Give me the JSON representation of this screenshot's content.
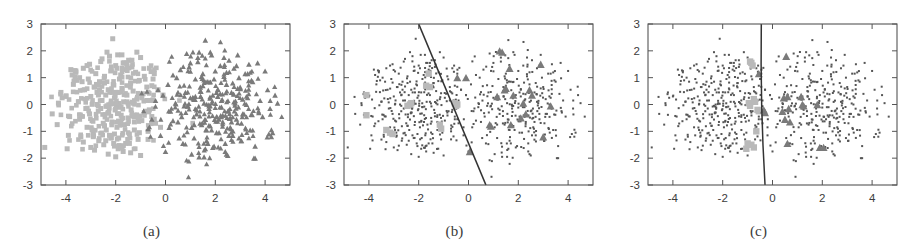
{
  "figure": {
    "title": "",
    "background_color": "#ffffff",
    "panel_count": 3
  },
  "panels": [
    {
      "id": "a",
      "caption": "(a)",
      "has_decision_boundary": false,
      "style": "all-points-large"
    },
    {
      "id": "b",
      "caption": "(b)",
      "has_decision_boundary": true,
      "style": "support-vectors-highlighted"
    },
    {
      "id": "c",
      "caption": "(c)",
      "has_decision_boundary": true,
      "style": "support-vectors-highlighted"
    }
  ],
  "axes": {
    "xlabel": "",
    "ylabel": "",
    "xlim": [
      -5,
      5
    ],
    "ylim": [
      -3,
      3
    ],
    "xticks": [
      -4,
      -2,
      0,
      2,
      4
    ],
    "xtick_labels": [
      "-4",
      "-2",
      "0",
      "2",
      "4"
    ],
    "yticks": [
      3,
      2,
      1,
      0,
      -1,
      -2,
      -3
    ],
    "ytick_labels": [
      "3",
      "2",
      "1",
      "0",
      "-1",
      "-2",
      "-3"
    ],
    "grid": false,
    "frame": true,
    "tick_direction": "in"
  },
  "colors": {
    "class1_marker": "#b9b9b9",
    "class2_marker": "#7a7a7a",
    "small_dot": "#555555",
    "frame": "#555555",
    "boundary_line": "#333333",
    "text": "#3c3c3c",
    "background": "#ffffff"
  },
  "legend": {
    "position": "none",
    "entries": [
      {
        "label": "class 1",
        "marker": "square",
        "color": "#b9b9b9"
      },
      {
        "label": "class 2",
        "marker": "triangle",
        "color": "#7a7a7a"
      }
    ]
  },
  "chart_data": {
    "type": "scatter",
    "title": "",
    "xlabel": "",
    "ylabel": "",
    "xlim": [
      -5,
      5
    ],
    "ylim": [
      -3,
      3
    ],
    "grid": false,
    "legend_position": "none",
    "panels": [
      {
        "id": "a",
        "caption": "(a)",
        "annotations": [],
        "decision_boundary": null,
        "series": [
          {
            "name": "class 1",
            "marker": "square",
            "color": "#b9b9b9",
            "size": "large",
            "x": [
              -4.85,
              -4.55,
              -4.3,
              -4.15,
              -3.95,
              -3.85,
              -3.7,
              -3.6,
              -3.5,
              -3.45,
              -3.4,
              -3.3,
              -3.25,
              -3.2,
              -3.15,
              -3.1,
              -3.05,
              -3.0,
              -2.95,
              -2.9,
              -2.85,
              -2.8,
              -2.75,
              -2.7,
              -2.68,
              -2.65,
              -2.6,
              -2.55,
              -2.5,
              -2.48,
              -2.45,
              -2.4,
              -2.38,
              -2.35,
              -2.3,
              -2.28,
              -2.25,
              -2.2,
              -2.18,
              -2.15,
              -2.12,
              -2.1,
              -2.08,
              -2.05,
              -2.0,
              -1.98,
              -1.95,
              -1.92,
              -1.9,
              -1.88,
              -1.85,
              -1.8,
              -1.78,
              -1.75,
              -1.72,
              -1.7,
              -1.68,
              -1.65,
              -1.6,
              -1.55,
              -1.5,
              -1.48,
              -1.45,
              -1.4,
              -1.38,
              -1.35,
              -1.3,
              -1.25,
              -1.2,
              -1.15,
              -1.1,
              -1.05,
              -1.0,
              -0.95,
              -0.9,
              -0.85,
              -0.8,
              -0.75,
              -0.7,
              -0.65,
              -0.6,
              -0.55,
              -0.5,
              -0.45,
              -0.4,
              -0.3,
              -0.2,
              -0.1,
              -2.6,
              -2.3,
              -2.0,
              -1.7,
              -1.4,
              -3.0,
              -3.3,
              -2.2,
              -1.9,
              -1.6,
              -2.4,
              -2.7,
              -1.3,
              -1.0,
              -0.7,
              -2.85,
              -2.55,
              -2.25,
              -1.95,
              -1.65,
              -1.35,
              -3.15,
              -3.45,
              -2.45,
              -2.15,
              -1.85,
              -1.55,
              -1.25,
              -0.95,
              -0.65,
              -4.0,
              -3.75,
              -3.55,
              -4.35,
              -2.75,
              -2.05,
              -1.45,
              -1.15,
              -0.85,
              -0.55,
              -2.9,
              -2.35,
              -1.75,
              -3.6,
              -3.9,
              -2.65,
              -1.05,
              -0.75,
              -4.2,
              -3.35,
              -2.95,
              -1.55,
              -0.45,
              -2.05,
              -2.45,
              -1.25,
              -3.05,
              -3.8
            ],
            "y": [
              -1.6,
              -0.35,
              0.05,
              0.25,
              -1.65,
              -0.45,
              0.75,
              1.2,
              0.1,
              -0.55,
              -1.2,
              1.35,
              0.55,
              -0.15,
              -0.85,
              0.95,
              1.5,
              0.3,
              -0.6,
              -1.05,
              0.65,
              1.15,
              0.45,
              -0.25,
              -1.35,
              0.85,
              1.6,
              0.15,
              -0.7,
              -1.5,
              1.05,
              0.35,
              -0.95,
              1.95,
              0.55,
              -0.3,
              -1.15,
              1.25,
              0.05,
              -0.65,
              2.45,
              0.75,
              -1.45,
              0.25,
              1.45,
              -0.05,
              -0.85,
              1.85,
              0.45,
              -1.25,
              0.95,
              1.1,
              -0.4,
              0.6,
              -1.55,
              1.55,
              0.1,
              -0.75,
              1.3,
              0.35,
              -0.5,
              1.65,
              -1.1,
              0.8,
              -0.2,
              1.4,
              0.5,
              -0.95,
              1.2,
              0.2,
              -1.3,
              0.9,
              1.75,
              -0.6,
              0.4,
              1.05,
              -0.25,
              0.65,
              -1.0,
              1.35,
              0.15,
              -0.45,
              0.95,
              1.15,
              -0.7,
              0.55,
              -0.85,
              0.35,
              -0.15,
              -1.85,
              -1.95,
              -1.75,
              -1.8,
              -1.6,
              -1.4,
              -1.25,
              -1.65,
              -1.45,
              -1.35,
              -0.05,
              0.05,
              -1.9,
              -1.3,
              -1.7,
              1.7,
              1.8,
              1.35,
              1.55,
              1.65,
              1.45,
              1.0,
              0.8,
              0.45,
              -0.1,
              0.1,
              -0.4,
              0.25,
              -0.2,
              0.3,
              1.1,
              0.9,
              -0.75,
              0.0,
              -1.55,
              -1.45,
              1.95,
              -0.3,
              0.7,
              -1.2,
              -0.05,
              1.85,
              1.25,
              -1.15,
              0.55,
              -1.05,
              0.15,
              0.45,
              0.85,
              -0.95,
              1.55,
              -0.55,
              -1.1,
              -0.8,
              -0.65,
              -0.35,
              1.3,
              -0.5
            ]
          },
          {
            "name": "class 2",
            "marker": "triangle",
            "color": "#7a7a7a",
            "size": "large",
            "x": [
              -0.7,
              -0.55,
              -0.4,
              -0.3,
              -0.2,
              -0.1,
              0.0,
              0.1,
              0.2,
              0.3,
              0.4,
              0.5,
              0.6,
              0.7,
              0.8,
              0.9,
              1.0,
              1.05,
              1.1,
              1.15,
              1.2,
              1.25,
              1.3,
              1.35,
              1.4,
              1.45,
              1.5,
              1.55,
              1.6,
              1.65,
              1.7,
              1.75,
              1.8,
              1.85,
              1.9,
              1.95,
              2.0,
              2.05,
              2.1,
              2.15,
              2.2,
              2.25,
              2.3,
              2.35,
              2.4,
              2.45,
              2.5,
              2.55,
              2.6,
              2.65,
              2.7,
              2.75,
              2.8,
              2.85,
              2.9,
              2.95,
              3.0,
              3.1,
              3.2,
              3.3,
              3.4,
              3.5,
              3.6,
              3.7,
              3.8,
              3.9,
              4.0,
              4.1,
              4.2,
              4.3,
              4.4,
              4.5,
              0.85,
              1.35,
              1.85,
              2.35,
              2.85,
              3.35,
              0.55,
              1.05,
              1.55,
              2.05,
              2.55,
              3.05,
              0.65,
              1.15,
              1.65,
              2.15,
              2.65,
              3.15,
              0.95,
              1.45,
              1.95,
              2.45,
              2.95,
              3.45,
              1.25,
              1.75,
              2.25,
              2.75,
              3.25,
              3.75,
              0.45,
              1.6,
              2.4,
              3.6,
              4.15,
              1.5,
              2.2,
              2.9,
              1.0,
              1.8,
              2.6,
              0.3,
              1.3,
              2.1,
              2.7,
              3.3,
              4.25,
              1.4,
              2.3,
              3.1,
              0.75,
              1.9,
              2.45,
              3.55,
              0.15,
              1.2,
              2.05,
              3.05,
              1.7,
              2.5
            ],
            "y": [
              -0.9,
              -0.55,
              0.15,
              0.55,
              -1.15,
              0.35,
              -1.75,
              0.75,
              -0.25,
              1.1,
              0.05,
              -0.65,
              1.3,
              -1.45,
              0.45,
              -0.05,
              1.55,
              -0.85,
              0.25,
              -1.25,
              0.95,
              -0.35,
              1.75,
              -1.95,
              0.65,
              -0.75,
              1.15,
              0.05,
              2.4,
              -1.35,
              0.85,
              -0.15,
              1.95,
              -0.95,
              0.35,
              -1.55,
              1.25,
              -0.45,
              0.55,
              -1.05,
              1.45,
              0.15,
              -0.65,
              1.05,
              -1.45,
              0.75,
              -0.25,
              1.65,
              -0.85,
              0.45,
              -1.15,
              1.35,
              0.05,
              -0.55,
              1.85,
              -1.25,
              0.65,
              -0.35,
              1.15,
              0.25,
              -0.95,
              0.85,
              -1.55,
              1.55,
              0.15,
              -0.45,
              1.25,
              0.55,
              -0.15,
              -1.05,
              0.35,
              0.05,
              1.9,
              1.95,
              1.85,
              1.75,
              1.45,
              1.5,
              -1.25,
              -1.85,
              -1.95,
              -1.05,
              -1.15,
              -1.35,
              -0.45,
              -0.75,
              -0.95,
              -0.55,
              -0.65,
              -0.35,
              1.4,
              1.05,
              0.95,
              1.2,
              1.0,
              0.9,
              -0.2,
              -0.05,
              -0.1,
              0.1,
              0.0,
              -0.3,
              1.0,
              -1.65,
              -1.75,
              -2.0,
              -1.1,
              0.7,
              0.4,
              0.6,
              0.25,
              -0.8,
              -0.5,
              -0.6,
              1.6,
              0.3,
              0.8,
              1.15,
              -1.2,
              0.5,
              -0.4,
              0.2,
              -0.05,
              -1.6,
              -1.85,
              -2.0,
              -0.85,
              0.3,
              0.45,
              -0.7,
              -1.45,
              -1.9
            ]
          }
        ]
      },
      {
        "id": "b",
        "caption": "(b)",
        "decision_boundary": {
          "type": "line",
          "x1": -2.0,
          "y1": 3.0,
          "x2": 0.7,
          "y2": -3.0
        },
        "annotations": [],
        "series": [
          {
            "name": "non support vectors",
            "marker": "dot",
            "color": "#555555",
            "size": "small",
            "note": "same points as panel (a), drawn tiny"
          },
          {
            "name": "support vectors class 1",
            "marker": "square",
            "color": "#b9b9b9",
            "size": "large",
            "x": [
              -4.1,
              -4.1,
              -3.3,
              -3.15,
              -3.05,
              -2.35,
              -2.3,
              -1.6,
              -1.55,
              -1.7,
              -1.15,
              -1.1,
              -0.55,
              -0.5,
              -0.45,
              -2.45
            ],
            "y": [
              0.35,
              -0.4,
              -0.95,
              -1.05,
              -1.1,
              0.0,
              0.05,
              1.15,
              0.65,
              0.7,
              -0.75,
              -0.9,
              0.05,
              -0.05,
              0.0,
              -0.05
            ]
          },
          {
            "name": "support vectors class 2",
            "marker": "triangle",
            "color": "#7a7a7a",
            "size": "large",
            "x": [
              -0.45,
              -0.1,
              0.05,
              0.85,
              0.9,
              1.25,
              1.35,
              1.45,
              1.5,
              1.65,
              1.7,
              2.1,
              2.2,
              2.3,
              2.45,
              2.9,
              3.0,
              3.3,
              1.15,
              1.8,
              2.55
            ],
            "y": [
              1.0,
              1.0,
              -1.75,
              -0.75,
              -0.8,
              2.0,
              1.95,
              0.55,
              0.6,
              1.35,
              -0.75,
              -0.5,
              0.05,
              -0.35,
              0.55,
              1.5,
              -1.2,
              -0.05,
              0.3,
              0.35,
              0.35
            ]
          }
        ]
      },
      {
        "id": "c",
        "caption": "(c)",
        "decision_boundary": {
          "type": "line",
          "x1": -0.45,
          "y1": 3.0,
          "x2": -0.3,
          "y2": -3.0,
          "curved": true
        },
        "annotations": [],
        "series": [
          {
            "name": "non support vectors",
            "marker": "dot",
            "color": "#555555",
            "size": "small",
            "note": "same points as panel (a), drawn tiny"
          },
          {
            "name": "support vectors class 1",
            "marker": "square",
            "color": "#b9b9b9",
            "size": "large",
            "x": [
              -0.9,
              -0.85,
              -0.8,
              -0.75,
              -0.7,
              -0.95,
              -0.6,
              -0.55,
              -0.65,
              -1.0,
              -0.85,
              -0.75,
              -1.05,
              -0.9
            ],
            "y": [
              1.6,
              1.55,
              1.45,
              0.2,
              0.1,
              0.05,
              -0.2,
              -0.25,
              -1.0,
              -1.45,
              -1.5,
              -1.6,
              -1.65,
              -0.05
            ]
          },
          {
            "name": "support vectors class 2",
            "marker": "triangle",
            "color": "#7a7a7a",
            "size": "large",
            "x": [
              -0.55,
              0.55,
              0.45,
              0.6,
              0.65,
              0.5,
              0.7,
              1.15,
              1.2,
              1.25,
              1.8,
              1.9,
              0.6,
              2.05,
              -0.35,
              -0.3,
              0.4
            ],
            "y": [
              1.15,
              1.8,
              0.25,
              0.3,
              -0.15,
              -0.55,
              -0.65,
              0.3,
              0.0,
              -0.05,
              0.0,
              -1.6,
              -1.45,
              -1.6,
              -0.2,
              -0.3,
              -0.25
            ]
          }
        ]
      }
    ]
  }
}
